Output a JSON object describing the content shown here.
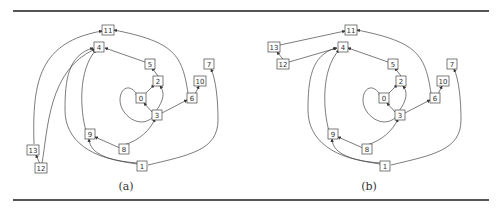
{
  "figure": {
    "panels": [
      {
        "caption": "(a)",
        "caption_x": 126,
        "nodes": [
          {
            "id": "11",
            "x": 108,
            "y": 30
          },
          {
            "id": "4",
            "x": 99,
            "y": 47
          },
          {
            "id": "5",
            "x": 150,
            "y": 64
          },
          {
            "id": "2",
            "x": 158,
            "y": 81
          },
          {
            "id": "0",
            "x": 141,
            "y": 98
          },
          {
            "id": "3",
            "x": 157,
            "y": 115
          },
          {
            "id": "6",
            "x": 192,
            "y": 98
          },
          {
            "id": "10",
            "x": 200,
            "y": 81
          },
          {
            "id": "7",
            "x": 209,
            "y": 64
          },
          {
            "id": "9",
            "x": 90,
            "y": 134
          },
          {
            "id": "8",
            "x": 124,
            "y": 149
          },
          {
            "id": "1",
            "x": 142,
            "y": 166
          },
          {
            "id": "13",
            "x": 33,
            "y": 150
          },
          {
            "id": "12",
            "x": 41,
            "y": 168
          }
        ],
        "edges": [
          {
            "d": "M34,144 C32,80 40,42 102,31"
          },
          {
            "d": "M188,93 C182,55 175,42 114,30"
          },
          {
            "d": "M145,62 L105,48"
          },
          {
            "d": "M158,76 L152,68"
          },
          {
            "d": "M145,94 L154,85"
          },
          {
            "d": "M156,111 C164,100 165,92 160,86"
          },
          {
            "d": "M152,112 L144,103"
          },
          {
            "d": "M153,117 C140,130 120,115 120,100 C120,88 130,82 138,96"
          },
          {
            "d": "M162,113 L187,100"
          },
          {
            "d": "M195,94 L199,86"
          },
          {
            "d": "M124,145 C140,140 150,130 155,119"
          },
          {
            "d": "M120,148 L95,137"
          },
          {
            "d": "M137,164 C110,160 90,155 89,139"
          },
          {
            "d": "M138,163 C90,160 65,140 65,110 C65,80 68,55 93,48"
          },
          {
            "d": "M148,165 C190,155 218,150 218,120 C218,100 216,80 211,69"
          },
          {
            "d": "M86,131 C80,110 78,70 96,50"
          },
          {
            "d": "M42,163 C48,130 48,70 95,49"
          },
          {
            "d": "M40,164 L36,155"
          }
        ]
      },
      {
        "caption": "(b)",
        "caption_x": 369,
        "nodes": [
          {
            "id": "11",
            "x": 351,
            "y": 30
          },
          {
            "id": "4",
            "x": 343,
            "y": 47
          },
          {
            "id": "5",
            "x": 393,
            "y": 64
          },
          {
            "id": "2",
            "x": 401,
            "y": 81
          },
          {
            "id": "0",
            "x": 384,
            "y": 98
          },
          {
            "id": "3",
            "x": 400,
            "y": 115
          },
          {
            "id": "6",
            "x": 435,
            "y": 98
          },
          {
            "id": "10",
            "x": 443,
            "y": 81
          },
          {
            "id": "7",
            "x": 452,
            "y": 64
          },
          {
            "id": "9",
            "x": 333,
            "y": 134
          },
          {
            "id": "8",
            "x": 367,
            "y": 149
          },
          {
            "id": "1",
            "x": 385,
            "y": 166
          },
          {
            "id": "13",
            "x": 274,
            "y": 47
          },
          {
            "id": "12",
            "x": 283,
            "y": 64
          }
        ],
        "edges": [
          {
            "d": "M280,45 L345,31"
          },
          {
            "d": "M431,93 C425,55 418,42 357,30"
          },
          {
            "d": "M388,62 L348,48"
          },
          {
            "d": "M401,76 L395,68"
          },
          {
            "d": "M388,94 L397,85"
          },
          {
            "d": "M399,111 C407,100 408,92 403,86"
          },
          {
            "d": "M395,112 L387,103"
          },
          {
            "d": "M396,117 C383,130 363,115 363,100 C363,88 373,82 381,96"
          },
          {
            "d": "M405,113 L430,100"
          },
          {
            "d": "M438,94 L442,86"
          },
          {
            "d": "M367,145 C383,140 393,130 398,119"
          },
          {
            "d": "M363,148 L338,137"
          },
          {
            "d": "M380,164 C353,160 333,155 332,139"
          },
          {
            "d": "M381,163 C333,160 308,140 308,110 C308,80 311,55 336,48"
          },
          {
            "d": "M391,165 C433,155 461,150 461,120 C461,100 459,80 454,69"
          },
          {
            "d": "M329,131 C323,110 321,70 339,50"
          },
          {
            "d": "M289,62 L337,48"
          },
          {
            "d": "M283,59 L277,52"
          }
        ]
      }
    ]
  }
}
